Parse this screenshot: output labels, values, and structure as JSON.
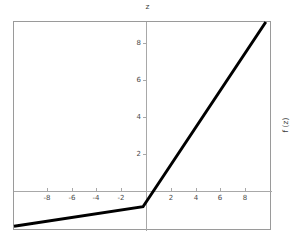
{
  "chart_data": {
    "type": "line",
    "title": "z",
    "xlabel": "",
    "ylabel": "f (z)",
    "ylabel_position": "right-rotated",
    "grid": false,
    "legend": null,
    "xlim": [
      -10.4,
      10.4
    ],
    "ylim": [
      -1.3,
      9.9
    ],
    "xticks": [
      -8,
      -6,
      -4,
      -2,
      2,
      4,
      6,
      8
    ],
    "yticks": [
      2,
      4,
      6,
      8
    ],
    "xticklabels": [
      "-8",
      "-6",
      "-4",
      "-2",
      "2",
      "4",
      "6",
      "8"
    ],
    "yticklabels": [
      "2",
      "4",
      "6",
      "8"
    ],
    "series": [
      {
        "name": "leaky-relu",
        "color": "#000000",
        "linewidth": 3,
        "x": [
          -10.4,
          0,
          9.9
        ],
        "y": [
          -1.04,
          0,
          9.9
        ],
        "description": "Leaky ReLU: slope 0.1 for z<0, slope 1 for z>0"
      }
    ],
    "annotations": []
  },
  "figure": {
    "title": "z",
    "right_axis_label": "f (z)",
    "background": "#ffffff",
    "frame_color": "#9a9a9a",
    "axis_color": "#a8a8a8",
    "tick_label_color": "#4a4a4a",
    "curve_color": "#000000"
  }
}
